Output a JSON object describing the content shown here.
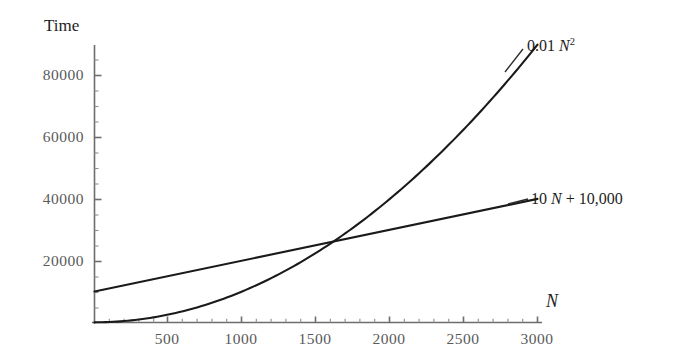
{
  "chart_data": {
    "type": "line",
    "title": "",
    "xlabel": "N",
    "ylabel": "Time",
    "xlim": [
      0,
      3050
    ],
    "ylim": [
      0,
      93000
    ],
    "grid": false,
    "legend_position": "inline-right",
    "xticks": [
      500,
      1000,
      1500,
      2000,
      2500,
      3000
    ],
    "xtick_labels": [
      "500",
      "1000",
      "1500",
      "2000",
      "2500",
      "3000"
    ],
    "yticks": [
      20000,
      40000,
      60000,
      80000
    ],
    "ytick_labels": [
      "20000",
      "40000",
      "60000",
      "80000"
    ],
    "minor_tick_step_x": 100,
    "minor_tick_step_y": 5000,
    "series": [
      {
        "name": "0.01 N^2",
        "label_text": "0.01 N",
        "label_sup": "2",
        "label_prefix": "0.01 ",
        "label_var": "N",
        "formula": "0.01*N^2",
        "x": [
          0,
          250,
          500,
          750,
          1000,
          1250,
          1500,
          1600,
          1750,
          2000,
          2250,
          2500,
          2750,
          3000
        ],
        "values": [
          0,
          625,
          2500,
          5625,
          10000,
          15625,
          22500,
          25600,
          30625,
          40000,
          50625,
          62500,
          75625,
          90000
        ]
      },
      {
        "name": "10 N + 10,000",
        "label_text": "10 N + 10,000",
        "label_prefix": "10 ",
        "label_var": "N",
        "label_suffix": " + 10,000",
        "formula": "10*N + 10000",
        "x": [
          0,
          500,
          1000,
          1500,
          1600,
          2000,
          2500,
          3000
        ],
        "values": [
          10000,
          15000,
          20000,
          25000,
          26000,
          30000,
          35000,
          40000
        ]
      }
    ],
    "intersection": {
      "x": 1600,
      "y": 26000
    },
    "colors": {
      "curve": "#1a1a1a",
      "axis": "#6b6b6b",
      "tick_label": "#5a5a5a",
      "axis_title": "#1d1d1d",
      "background": "#ffffff"
    }
  },
  "labels": {
    "y_axis_title": "Time",
    "x_axis_title": "N",
    "quad_prefix": "0.01 ",
    "quad_var": "N",
    "quad_exp": "2",
    "lin_prefix": "10 ",
    "lin_var": "N",
    "lin_suffix": " + 10,000"
  },
  "ytick_labels": [
    "80000",
    "60000",
    "40000",
    "20000"
  ],
  "xtick_labels": [
    "500",
    "1000",
    "1500",
    "2000",
    "2500",
    "3000"
  ]
}
